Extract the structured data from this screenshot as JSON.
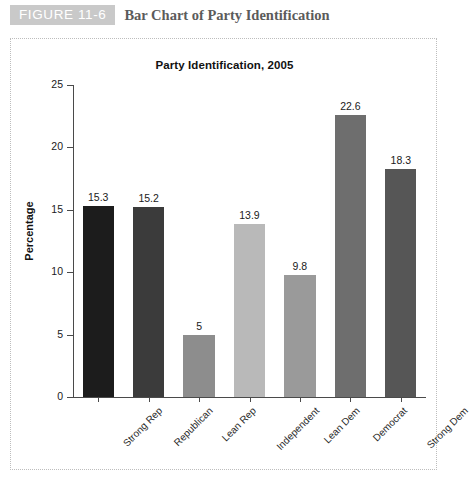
{
  "header": {
    "badge_label": "FIGURE 11-6",
    "title": "Bar Chart of Party Identification",
    "badge_color": "#c9c9c9",
    "title_color": "#5b5b5b"
  },
  "chart_data": {
    "type": "bar",
    "title": "Party Identification, 2005",
    "xlabel": "",
    "ylabel": "Percentage",
    "ylim": [
      0,
      25
    ],
    "yticks": [
      0,
      5,
      10,
      15,
      20,
      25
    ],
    "ytick_labels": [
      "0",
      "5",
      "10",
      "15",
      "20",
      "25"
    ],
    "grid": false,
    "legend": "none",
    "categories": [
      "Strong Rep",
      "Republican",
      "Lean Rep",
      "Independent",
      "Lean Dem",
      "Democrat",
      "Strong Dem"
    ],
    "values": [
      15.3,
      15.2,
      5,
      13.9,
      9.8,
      22.6,
      18.3
    ],
    "value_labels": [
      "15.3",
      "15.2",
      "5",
      "13.9",
      "9.8",
      "22.6",
      "18.3"
    ],
    "bar_colors": [
      "#1c1c1c",
      "#3b3b3b",
      "#8d8d8d",
      "#b9b9b9",
      "#9a9a9a",
      "#6e6e6e",
      "#565656"
    ]
  }
}
